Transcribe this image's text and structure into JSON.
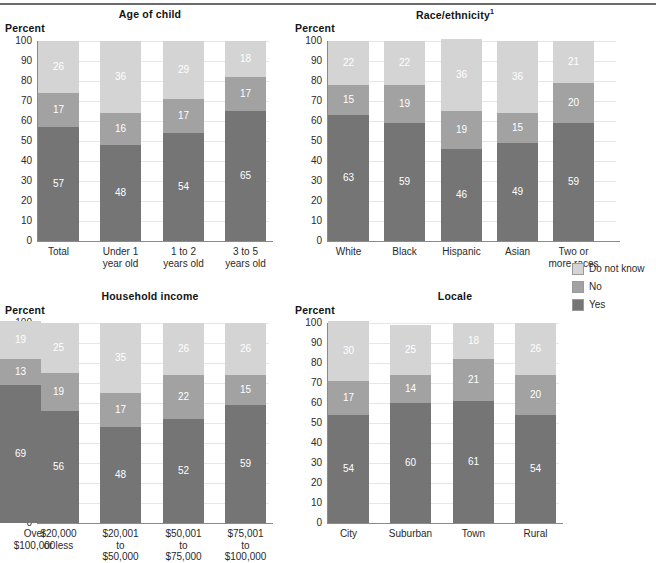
{
  "figure": {
    "legend": {
      "items": [
        {
          "label": "Do not know",
          "color": "#d4d4d4",
          "key": "do_not_know"
        },
        {
          "label": "No",
          "color": "#a2a2a2",
          "key": "no"
        },
        {
          "label": "Yes",
          "color": "#757575",
          "key": "yes"
        }
      ]
    },
    "axis_ticks": [
      "100",
      "90",
      "80",
      "70",
      "60",
      "50",
      "40",
      "30",
      "20",
      "10",
      "0"
    ],
    "y_axis_title": "Percent"
  },
  "chart_data": [
    {
      "type": "bar",
      "subtype": "stacked-bar-100",
      "title": "Age of child",
      "title_superscript": "",
      "panel": "top-left",
      "xlabel": "",
      "ylabel": "Percent",
      "ylim": [
        0,
        100
      ],
      "yticks": [
        0,
        10,
        20,
        30,
        40,
        50,
        60,
        70,
        80,
        90,
        100
      ],
      "grid": true,
      "legend_position": "figure-right-middle",
      "categories": [
        "Total",
        "Under 1 year old",
        "1 to 2 years old",
        "3 to 5 years old"
      ],
      "category_lines": [
        [
          "Total"
        ],
        [
          "Under 1",
          "year old"
        ],
        [
          "1 to 2",
          "years old"
        ],
        [
          "3 to 5",
          "years old"
        ]
      ],
      "series": [
        {
          "name": "Yes",
          "values": [
            57,
            48,
            54,
            65
          ]
        },
        {
          "name": "No",
          "values": [
            17,
            16,
            17,
            17
          ]
        },
        {
          "name": "Do not know",
          "values": [
            26,
            36,
            29,
            18
          ]
        }
      ]
    },
    {
      "type": "bar",
      "subtype": "stacked-bar-100",
      "title": "Race/ethnicity",
      "title_superscript": "1",
      "panel": "top-right",
      "xlabel": "",
      "ylabel": "Percent",
      "ylim": [
        0,
        100
      ],
      "yticks": [
        0,
        10,
        20,
        30,
        40,
        50,
        60,
        70,
        80,
        90,
        100
      ],
      "grid": true,
      "legend_position": "figure-right-middle",
      "categories": [
        "White",
        "Black",
        "Hispanic",
        "Asian",
        "Two or more races"
      ],
      "category_lines": [
        [
          "White"
        ],
        [
          "Black"
        ],
        [
          "Hispanic"
        ],
        [
          "Asian"
        ],
        [
          "Two or",
          "more races"
        ]
      ],
      "series": [
        {
          "name": "Yes",
          "values": [
            63,
            59,
            46,
            49,
            59
          ]
        },
        {
          "name": "No",
          "values": [
            15,
            19,
            19,
            15,
            20
          ]
        },
        {
          "name": "Do not know",
          "values": [
            22,
            22,
            36,
            36,
            21
          ]
        }
      ]
    },
    {
      "type": "bar",
      "subtype": "stacked-bar-100",
      "title": "Household income",
      "title_superscript": "",
      "panel": "bottom-left",
      "xlabel": "",
      "ylabel": "Percent",
      "ylim": [
        0,
        100
      ],
      "yticks": [
        0,
        10,
        20,
        30,
        40,
        50,
        60,
        70,
        80,
        90,
        100
      ],
      "grid": true,
      "legend_position": "figure-right-middle",
      "categories": [
        "$20,000 or less",
        "$20,001 to $50,000",
        "$50,001 to $75,000",
        "$75,001 to $100,000",
        "Over $100,000"
      ],
      "category_lines": [
        [
          "$20,000",
          "or less"
        ],
        [
          "$20,001",
          "to",
          "$50,000"
        ],
        [
          "$50,001",
          "to",
          "$75,000"
        ],
        [
          "$75,001",
          "to",
          "$100,000"
        ],
        [
          "Over",
          "$100,000"
        ]
      ],
      "series": [
        {
          "name": "Yes",
          "values": [
            56,
            48,
            52,
            59,
            69
          ]
        },
        {
          "name": "No",
          "values": [
            19,
            17,
            22,
            15,
            13
          ]
        },
        {
          "name": "Do not know",
          "values": [
            25,
            35,
            26,
            26,
            19
          ]
        }
      ]
    },
    {
      "type": "bar",
      "subtype": "stacked-bar-100",
      "title": "Locale",
      "title_superscript": "",
      "panel": "bottom-right",
      "xlabel": "",
      "ylabel": "Percent",
      "ylim": [
        0,
        100
      ],
      "yticks": [
        0,
        10,
        20,
        30,
        40,
        50,
        60,
        70,
        80,
        90,
        100
      ],
      "grid": true,
      "legend_position": "figure-right-middle",
      "categories": [
        "City",
        "Suburban",
        "Town",
        "Rural"
      ],
      "category_lines": [
        [
          "City"
        ],
        [
          "Suburban"
        ],
        [
          "Town"
        ],
        [
          "Rural"
        ]
      ],
      "series": [
        {
          "name": "Yes",
          "values": [
            54,
            60,
            61,
            54
          ]
        },
        {
          "name": "No",
          "values": [
            17,
            14,
            21,
            20
          ]
        },
        {
          "name": "Do not know",
          "values": [
            30,
            25,
            18,
            26
          ]
        }
      ]
    }
  ]
}
